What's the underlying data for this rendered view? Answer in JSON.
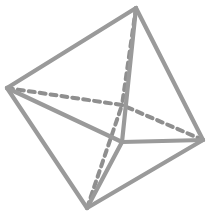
{
  "figure": {
    "name": "octahedron-wireframe",
    "kind": "geometric-solid",
    "solid_name": "octahedron",
    "background_color": "#ffffff",
    "visible_edge_color": "#9a9a9a",
    "hidden_edge_color": "#8f8f8f",
    "face_color": "#ffffff",
    "visible_edge_width": 4.2,
    "hidden_edge_width": 4.0,
    "hidden_dash_pattern": "6 5",
    "vertex_count": 6,
    "edge_count": 12,
    "face_count": 8
  },
  "vertices": {
    "top": {
      "label": "top",
      "x": 136,
      "y": 8
    },
    "left": {
      "label": "left",
      "x": 7,
      "y": 88
    },
    "right": {
      "label": "right",
      "x": 203,
      "y": 140
    },
    "bottom": {
      "label": "bottom",
      "x": 87,
      "y": 208
    },
    "front": {
      "label": "front",
      "x": 122,
      "y": 142
    },
    "back": {
      "label": "back",
      "x": 122,
      "y": 105
    }
  },
  "edges": {
    "visible": [
      {
        "id": "top-left",
        "from": "top",
        "to": "left",
        "points": "136,8 7,88"
      },
      {
        "id": "top-right",
        "from": "top",
        "to": "right",
        "points": "136,8 203,140"
      },
      {
        "id": "left-bottom",
        "from": "left",
        "to": "bottom",
        "points": "7,88 87,208"
      },
      {
        "id": "right-bottom",
        "from": "right",
        "to": "bottom",
        "points": "203,140 87,208"
      },
      {
        "id": "top-front",
        "from": "top",
        "to": "front",
        "points": "136,8 122,142"
      },
      {
        "id": "left-front",
        "from": "left",
        "to": "front",
        "points": "7,88 122,142"
      },
      {
        "id": "right-front",
        "from": "right",
        "to": "front",
        "points": "203,140 122,142"
      },
      {
        "id": "bottom-front",
        "from": "bottom",
        "to": "front",
        "points": "87,208 122,142"
      }
    ],
    "hidden": [
      {
        "id": "top-back",
        "from": "top",
        "to": "back",
        "points": "136,8 122,105"
      },
      {
        "id": "left-back",
        "from": "left",
        "to": "back",
        "points": "7,88 122,105"
      },
      {
        "id": "right-back",
        "from": "right",
        "to": "back",
        "points": "203,140 122,105"
      },
      {
        "id": "bottom-back",
        "from": "bottom",
        "to": "back",
        "points": "87,208 122,105"
      }
    ]
  },
  "silhouette": {
    "id": "outer-quadrilateral",
    "points": "136,8 203,140 87,208 7,88"
  }
}
